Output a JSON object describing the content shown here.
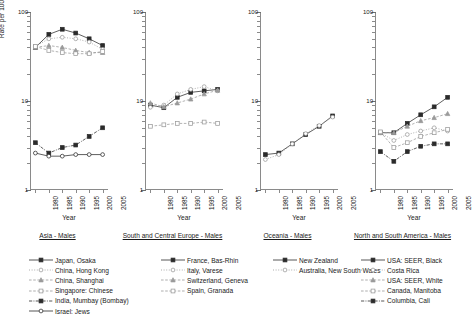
{
  "figure": {
    "ylabel": "Rate per 100,000 person-years",
    "xlabel": "Year",
    "y_ticks": [
      "100",
      "10",
      "1"
    ],
    "x_ticks": [
      "1980",
      "1985",
      "1990",
      "1995",
      "2000",
      "2005"
    ]
  },
  "chart_data": {
    "type": "line",
    "title": "",
    "xlabel": "Year",
    "ylabel": "Rate per 100,000 person-years",
    "yscale": "log",
    "ylim": [
      1,
      100
    ],
    "xlim": [
      1978,
      2007
    ],
    "grid": false,
    "legend_position": "bottom",
    "x": [
      1980,
      1985,
      1990,
      1995,
      2000,
      2005
    ],
    "panels": [
      {
        "title": "Asia - Males",
        "series": [
          {
            "name": "Japan, Osaka",
            "marker": "filled-square",
            "line": "solid",
            "values": [
              40,
              56,
              64,
              58,
              50,
              42
            ]
          },
          {
            "name": "China, Hong Kong",
            "marker": "open-circle",
            "line": "dotted",
            "values": [
              41,
              50,
              52,
              50,
              46,
              38
            ]
          },
          {
            "name": "China, Shanghai",
            "marker": "filled-triangle",
            "line": "dashed",
            "values": [
              40,
              42,
              40,
              37,
              35,
              35
            ]
          },
          {
            "name": "Singapore: Chinese",
            "marker": "open-square",
            "line": "dashed",
            "values": [
              41,
              37,
              35,
              34,
              34,
              36
            ]
          },
          {
            "name": "India, Mumbay (Bombay)",
            "marker": "filled-square",
            "line": "dash-dot",
            "values": [
              3.4,
              2.6,
              3.0,
              3.2,
              4.0,
              5.0
            ]
          },
          {
            "name": "Israel: Jews",
            "marker": "open-circle",
            "line": "solid",
            "values": [
              2.6,
              2.4,
              2.4,
              2.5,
              2.5,
              2.5
            ]
          }
        ]
      },
      {
        "title": "South and Central Europe - Males",
        "series": [
          {
            "name": "France, Bas-Rhin",
            "marker": "filled-square",
            "line": "solid",
            "values": [
              9.0,
              8.4,
              11.0,
              12.5,
              13.0,
              13.5
            ]
          },
          {
            "name": "Italy, Varese",
            "marker": "open-circle",
            "line": "dotted",
            "values": [
              8.5,
              9.0,
              12.0,
              13.5,
              14.5,
              13.0
            ]
          },
          {
            "name": "Switzerland, Geneva",
            "marker": "filled-triangle",
            "line": "dashed",
            "values": [
              9.5,
              8.6,
              9.5,
              10.5,
              12.0,
              13.2
            ]
          },
          {
            "name": "Spain, Granada",
            "marker": "open-square",
            "line": "dashed",
            "values": [
              5.2,
              5.4,
              5.6,
              5.6,
              5.8,
              5.6
            ]
          }
        ]
      },
      {
        "title": "Oceania - Males",
        "series": [
          {
            "name": "New Zealand",
            "marker": "filled-square",
            "line": "solid",
            "values": [
              2.5,
              2.6,
              3.3,
              4.2,
              5.2,
              6.8
            ]
          },
          {
            "name": "Australia, New South Wales",
            "marker": "open-circle",
            "line": "dotted",
            "values": [
              2.2,
              2.5,
              3.3,
              4.3,
              5.3,
              6.6
            ]
          }
        ]
      },
      {
        "title": "North and South America - Males",
        "series": [
          {
            "name": "USA: SEER, Black",
            "marker": "filled-square",
            "line": "solid",
            "values": [
              4.4,
              4.4,
              5.6,
              7.0,
              8.6,
              11.0
            ]
          },
          {
            "name": "Costa Rica",
            "marker": "open-circle",
            "line": "dotted",
            "values": [
              4.4,
              3.6,
              4.2,
              4.6,
              5.0,
              4.6
            ]
          },
          {
            "name": "USA: SEER, White",
            "marker": "filled-triangle",
            "line": "dashed",
            "values": [
              4.4,
              4.4,
              5.2,
              6.0,
              6.5,
              7.2
            ]
          },
          {
            "name": "Canada, Manitoba",
            "marker": "open-square",
            "line": "dashed",
            "values": [
              4.5,
              3.0,
              3.4,
              4.0,
              4.4,
              4.8
            ]
          },
          {
            "name": "Columbia, Cali",
            "marker": "filled-square",
            "line": "dash-dot",
            "values": [
              2.7,
              2.1,
              2.7,
              3.1,
              3.3,
              3.3
            ]
          }
        ]
      }
    ]
  },
  "legend": {
    "columns": [
      {
        "items": [
          {
            "label": "Japan, Osaka",
            "marker": "filled-square",
            "line": "solid"
          },
          {
            "label": "China, Hong Kong",
            "marker": "open-circle",
            "line": "dotted"
          },
          {
            "label": "China, Shanghai",
            "marker": "filled-triangle",
            "line": "dashed"
          },
          {
            "label": "Singapore: Chinese",
            "marker": "open-square",
            "line": "dashed"
          },
          {
            "label": "India, Mumbay (Bombay)",
            "marker": "filled-square",
            "line": "dash-dot"
          },
          {
            "label": "Israel: Jews",
            "marker": "open-circle",
            "line": "solid"
          }
        ]
      },
      {
        "items": [
          {
            "label": "France, Bas-Rhin",
            "marker": "filled-square",
            "line": "solid"
          },
          {
            "label": "Italy, Varese",
            "marker": "open-circle",
            "line": "dotted"
          },
          {
            "label": "Switzerland, Geneva",
            "marker": "filled-triangle",
            "line": "dashed"
          },
          {
            "label": "Spain, Granada",
            "marker": "open-square",
            "line": "dashed"
          }
        ]
      },
      {
        "items": [
          {
            "label": "New Zealand",
            "marker": "filled-square",
            "line": "solid"
          },
          {
            "label": "Australia, New South Wales",
            "marker": "open-circle",
            "line": "dotted"
          }
        ]
      },
      {
        "items": [
          {
            "label": "USA: SEER, Black",
            "marker": "filled-square",
            "line": "solid"
          },
          {
            "label": "Costa Rica",
            "marker": "open-circle",
            "line": "dotted"
          },
          {
            "label": "USA: SEER, White",
            "marker": "filled-triangle",
            "line": "dashed"
          },
          {
            "label": "Canada, Manitoba",
            "marker": "open-square",
            "line": "dashed"
          },
          {
            "label": "Columbia, Cali",
            "marker": "filled-square",
            "line": "dash-dot"
          }
        ]
      }
    ]
  },
  "colors": {
    "ink": "#1a1a1a",
    "axis": "#8a8a8a",
    "series_dark": "#2b2b2b",
    "series_light": "#9a9a9a"
  }
}
